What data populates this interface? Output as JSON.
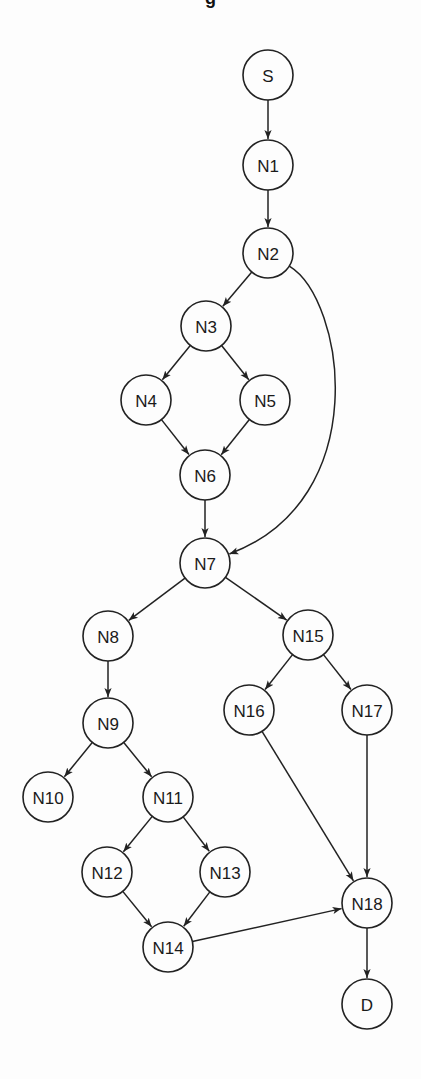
{
  "title_fragment": "g",
  "colors": {
    "background": "#fdfdfd",
    "stroke": "#222222",
    "text": "#1a1a1a"
  },
  "node_radius": 25,
  "nodes": [
    {
      "id": "S",
      "label": "S",
      "x": 268,
      "y": 75
    },
    {
      "id": "N1",
      "label": "N1",
      "x": 268,
      "y": 165
    },
    {
      "id": "N2",
      "label": "N2",
      "x": 268,
      "y": 253
    },
    {
      "id": "N3",
      "label": "N3",
      "x": 206,
      "y": 326
    },
    {
      "id": "N4",
      "label": "N4",
      "x": 146,
      "y": 400
    },
    {
      "id": "N5",
      "label": "N5",
      "x": 265,
      "y": 400
    },
    {
      "id": "N6",
      "label": "N6",
      "x": 205,
      "y": 475
    },
    {
      "id": "N7",
      "label": "N7",
      "x": 205,
      "y": 563
    },
    {
      "id": "N8",
      "label": "N8",
      "x": 108,
      "y": 636
    },
    {
      "id": "N9",
      "label": "N9",
      "x": 108,
      "y": 723
    },
    {
      "id": "N10",
      "label": "N10",
      "x": 48,
      "y": 797
    },
    {
      "id": "N11",
      "label": "N11",
      "x": 168,
      "y": 797
    },
    {
      "id": "N12",
      "label": "N12",
      "x": 107,
      "y": 872
    },
    {
      "id": "N13",
      "label": "N13",
      "x": 225,
      "y": 872
    },
    {
      "id": "N14",
      "label": "N14",
      "x": 168,
      "y": 947
    },
    {
      "id": "N15",
      "label": "N15",
      "x": 308,
      "y": 635
    },
    {
      "id": "N16",
      "label": "N16",
      "x": 249,
      "y": 710
    },
    {
      "id": "N17",
      "label": "N17",
      "x": 367,
      "y": 710
    },
    {
      "id": "N18",
      "label": "N18",
      "x": 367,
      "y": 903
    },
    {
      "id": "D",
      "label": "D",
      "x": 367,
      "y": 1004
    }
  ],
  "edges": [
    {
      "from": "S",
      "to": "N1"
    },
    {
      "from": "N1",
      "to": "N2"
    },
    {
      "from": "N2",
      "to": "N3"
    },
    {
      "from": "N2",
      "to": "N7",
      "curve": {
        "c1": [
          345,
          300
        ],
        "c2": [
          375,
          500
        ]
      }
    },
    {
      "from": "N3",
      "to": "N4"
    },
    {
      "from": "N3",
      "to": "N5"
    },
    {
      "from": "N4",
      "to": "N6"
    },
    {
      "from": "N5",
      "to": "N6"
    },
    {
      "from": "N6",
      "to": "N7"
    },
    {
      "from": "N7",
      "to": "N8"
    },
    {
      "from": "N7",
      "to": "N15"
    },
    {
      "from": "N8",
      "to": "N9"
    },
    {
      "from": "N9",
      "to": "N10"
    },
    {
      "from": "N9",
      "to": "N11"
    },
    {
      "from": "N11",
      "to": "N12"
    },
    {
      "from": "N11",
      "to": "N13"
    },
    {
      "from": "N12",
      "to": "N14"
    },
    {
      "from": "N13",
      "to": "N14"
    },
    {
      "from": "N14",
      "to": "N18"
    },
    {
      "from": "N15",
      "to": "N16"
    },
    {
      "from": "N15",
      "to": "N17"
    },
    {
      "from": "N16",
      "to": "N18"
    },
    {
      "from": "N17",
      "to": "N18"
    },
    {
      "from": "N18",
      "to": "D"
    }
  ]
}
